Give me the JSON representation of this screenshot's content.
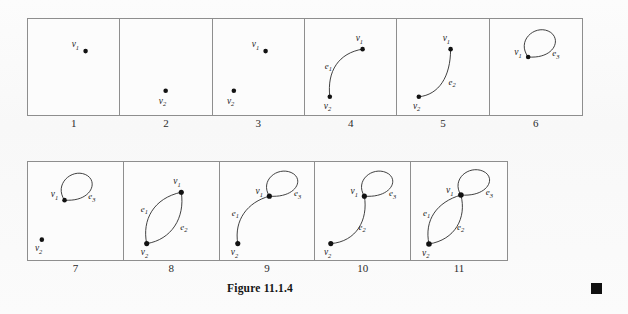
{
  "figure": {
    "caption": "Figure 11.1.4",
    "end_marker": "filled-square"
  },
  "vertex_labels": {
    "v1": "v",
    "v1_sub": "1",
    "v2": "v",
    "v2_sub": "2"
  },
  "edge_labels": {
    "e1": "e",
    "e1_sub": "1",
    "e2": "e",
    "e2_sub": "2",
    "e3": "e",
    "e3_sub": "3"
  },
  "rows": [
    {
      "name": "top-row",
      "panels": [
        {
          "number": "1",
          "vertices": [
            "v1"
          ],
          "edges": []
        },
        {
          "number": "2",
          "vertices": [
            "v2"
          ],
          "edges": []
        },
        {
          "number": "3",
          "vertices": [
            "v1",
            "v2"
          ],
          "edges": []
        },
        {
          "number": "4",
          "vertices": [
            "v1",
            "v2"
          ],
          "edges": [
            "e1"
          ]
        },
        {
          "number": "5",
          "vertices": [
            "v1",
            "v2"
          ],
          "edges": [
            "e2"
          ]
        },
        {
          "number": "6",
          "vertices": [
            "v1"
          ],
          "edges": [
            "e3"
          ]
        }
      ]
    },
    {
      "name": "bottom-row",
      "panels": [
        {
          "number": "7",
          "vertices": [
            "v1",
            "v2"
          ],
          "edges": [
            "e3"
          ]
        },
        {
          "number": "8",
          "vertices": [
            "v1",
            "v2"
          ],
          "edges": [
            "e1",
            "e2"
          ]
        },
        {
          "number": "9",
          "vertices": [
            "v1",
            "v2"
          ],
          "edges": [
            "e1",
            "e3"
          ]
        },
        {
          "number": "10",
          "vertices": [
            "v1",
            "v2"
          ],
          "edges": [
            "e2",
            "e3"
          ]
        },
        {
          "number": "11",
          "vertices": [
            "v1",
            "v2"
          ],
          "edges": [
            "e1",
            "e2",
            "e3"
          ]
        }
      ]
    }
  ],
  "colors": {
    "ink": "#1a1a1a",
    "border": "#8e8e8e",
    "paper": "#fbfbfb",
    "marker": "#101010"
  }
}
